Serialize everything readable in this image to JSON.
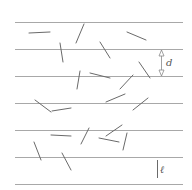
{
  "diagram": {
    "colors": {
      "background": "#ffffff",
      "grid_line": "#a8a8a8",
      "needle": "#6a6a6a",
      "annotation": "#8a8a8a",
      "label": "#555555"
    },
    "parallel_lines": {
      "x_start": 15,
      "x_end": 183,
      "y": [
        22,
        49,
        76,
        103,
        130,
        157,
        184
      ]
    },
    "needles": [
      {
        "x1": 29,
        "y1": 33,
        "x2": 50,
        "y2": 32
      },
      {
        "x1": 84,
        "y1": 24,
        "x2": 76,
        "y2": 43
      },
      {
        "x1": 60,
        "y1": 43,
        "x2": 63,
        "y2": 62
      },
      {
        "x1": 127,
        "y1": 32,
        "x2": 146,
        "y2": 40
      },
      {
        "x1": 100,
        "y1": 42,
        "x2": 110,
        "y2": 58
      },
      {
        "x1": 139,
        "y1": 62,
        "x2": 150,
        "y2": 78
      },
      {
        "x1": 80,
        "y1": 71,
        "x2": 77,
        "y2": 89
      },
      {
        "x1": 90,
        "y1": 73,
        "x2": 110,
        "y2": 78
      },
      {
        "x1": 133,
        "y1": 75,
        "x2": 120,
        "y2": 89
      },
      {
        "x1": 106,
        "y1": 102,
        "x2": 125,
        "y2": 94
      },
      {
        "x1": 133,
        "y1": 110,
        "x2": 148,
        "y2": 98
      },
      {
        "x1": 35,
        "y1": 100,
        "x2": 51,
        "y2": 112
      },
      {
        "x1": 52,
        "y1": 111,
        "x2": 71,
        "y2": 108
      },
      {
        "x1": 51,
        "y1": 135,
        "x2": 71,
        "y2": 136
      },
      {
        "x1": 89,
        "y1": 128,
        "x2": 81,
        "y2": 144
      },
      {
        "x1": 122,
        "y1": 125,
        "x2": 106,
        "y2": 136
      },
      {
        "x1": 99,
        "y1": 138,
        "x2": 119,
        "y2": 142
      },
      {
        "x1": 127,
        "y1": 133,
        "x2": 123,
        "y2": 150
      },
      {
        "x1": 34,
        "y1": 142,
        "x2": 41,
        "y2": 160
      },
      {
        "x1": 62,
        "y1": 153,
        "x2": 71,
        "y2": 170
      }
    ],
    "spacing_annotation": {
      "label": "d",
      "x": 161,
      "y_top": 49,
      "y_bottom": 76,
      "label_x": 166,
      "label_y": 66
    },
    "length_annotation": {
      "label": "ℓ",
      "x": 157,
      "y_top": 160,
      "y_bottom": 178,
      "label_x": 160,
      "label_y": 173
    }
  }
}
